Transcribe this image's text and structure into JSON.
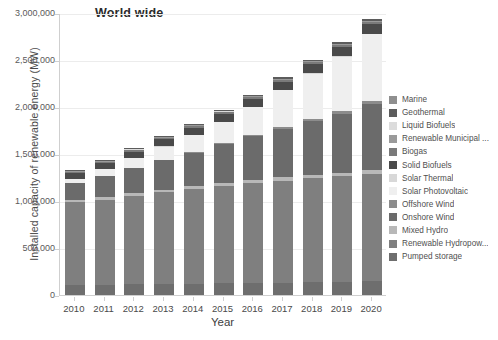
{
  "chart_data": {
    "type": "bar",
    "subtype": "stacked-bar",
    "title": "World wide",
    "xlabel": "Year",
    "ylabel": "Installed capacity of renewable energy (MW)",
    "categories": [
      "2010",
      "2011",
      "2012",
      "2013",
      "2014",
      "2015",
      "2016",
      "2017",
      "2018",
      "2019",
      "2020"
    ],
    "ylim": [
      0,
      3000000
    ],
    "yticks": [
      0,
      500000,
      1000000,
      1500000,
      2000000,
      2500000,
      3000000
    ],
    "ytick_labels": [
      "0",
      "500,000",
      "1,000,000",
      "1,500,000",
      "2,000,000",
      "2,500,000",
      "3,000,000"
    ],
    "grid": true,
    "legend_position": "right",
    "stack_order_bottom_to_top": [
      "Pumped storage",
      "Renewable Hydropower",
      "Mixed Hydro",
      "Onshore Wind",
      "Offshore Wind",
      "Solar Photovoltaic",
      "Solar Thermal",
      "Solid Biofuels",
      "Biogas",
      "Renewable Municipal Waste",
      "Liquid Biofuels",
      "Geothermal",
      "Marine"
    ],
    "series": [
      {
        "name": "Pumped storage",
        "color": "#6e6e6e",
        "values": [
          108000,
          110000,
          112000,
          116000,
          120000,
          124000,
          128000,
          132000,
          136000,
          140000,
          144000
        ]
      },
      {
        "name": "Renewable Hydropower",
        "color": "#7f7f7f",
        "values": [
          880000,
          905000,
          940000,
          975000,
          1005000,
          1035000,
          1060000,
          1085000,
          1105000,
          1125000,
          1145000
        ]
      },
      {
        "name": "Mixed Hydro",
        "color": "#b8b8b8",
        "values": [
          28000,
          29000,
          30000,
          31000,
          32000,
          33000,
          34000,
          35000,
          36000,
          37000,
          38000
        ]
      },
      {
        "name": "Onshore Wind",
        "color": "#6b6b6b",
        "values": [
          178000,
          220000,
          267000,
          312000,
          355000,
          415000,
          468000,
          515000,
          570000,
          625000,
          705000
        ]
      },
      {
        "name": "Offshore Wind",
        "color": "#8c8c8c",
        "values": [
          3000,
          4200,
          5400,
          7100,
          8800,
          12200,
          14400,
          19000,
          23000,
          28000,
          34000
        ]
      },
      {
        "name": "Solar Photovoltaic",
        "color": "#efefef",
        "values": [
          40000,
          70000,
          100000,
          138000,
          177000,
          220000,
          295000,
          390000,
          485000,
          580000,
          710000
        ]
      },
      {
        "name": "Solar Thermal",
        "color": "#d8d8d8",
        "values": [
          1200,
          1700,
          2600,
          3500,
          4400,
          4800,
          4900,
          5100,
          5500,
          6100,
          6400
        ]
      },
      {
        "name": "Solid Biofuels",
        "color": "#4a4a4a",
        "values": [
          62000,
          66000,
          70000,
          74000,
          78000,
          82000,
          86000,
          90000,
          94000,
          98000,
          102000
        ]
      },
      {
        "name": "Biogas",
        "color": "#7a7a7a",
        "values": [
          10000,
          11500,
          13000,
          14500,
          16000,
          17500,
          18500,
          19500,
          20500,
          21500,
          22500
        ]
      },
      {
        "name": "Renewable Municipal Waste",
        "color": "#9a9a9a",
        "values": [
          6500,
          7000,
          7500,
          8000,
          8500,
          9000,
          9500,
          10000,
          10500,
          11000,
          11500
        ]
      },
      {
        "name": "Liquid Biofuels",
        "color": "#dcdcdc",
        "values": [
          1200,
          1300,
          1400,
          1500,
          1600,
          1700,
          1800,
          1900,
          2000,
          2100,
          2200
        ]
      },
      {
        "name": "Geothermal",
        "color": "#5c5c5c",
        "values": [
          10000,
          10400,
          10800,
          11300,
          11800,
          12200,
          12600,
          13100,
          13600,
          14100,
          14600
        ]
      },
      {
        "name": "Marine",
        "color": "#8f8f8f",
        "values": [
          500,
          500,
          500,
          500,
          500,
          500,
          500,
          500,
          500,
          500,
          500
        ]
      }
    ],
    "totals": [
      1328400,
      1436100,
      1559200,
      1691900,
      1818600,
      1966900,
      2133700,
      2315600,
      2501600,
      2707800,
      2935200
    ]
  },
  "legend": {
    "items": [
      {
        "label": "Marine",
        "color": "#8f8f8f"
      },
      {
        "label": "Geothermal",
        "color": "#5c5c5c"
      },
      {
        "label": "Liquid Biofuels",
        "color": "#dcdcdc"
      },
      {
        "label": "Renewable Municipal ...",
        "color": "#9a9a9a"
      },
      {
        "label": "Biogas",
        "color": "#7a7a7a"
      },
      {
        "label": "Solid Biofuels",
        "color": "#4a4a4a"
      },
      {
        "label": "Solar Thermal",
        "color": "#d8d8d8"
      },
      {
        "label": "Solar Photovoltaic",
        "color": "#efefef"
      },
      {
        "label": "Offshore Wind",
        "color": "#8c8c8c"
      },
      {
        "label": "Onshore Wind",
        "color": "#6b6b6b"
      },
      {
        "label": "Mixed Hydro",
        "color": "#b8b8b8"
      },
      {
        "label": "Renewable Hydropow...",
        "color": "#7f7f7f"
      },
      {
        "label": "Pumped storage",
        "color": "#6e6e6e"
      }
    ]
  },
  "colors": {
    "axis": "#cfcfcf",
    "grid": "#ececec",
    "text": "#4a4a4a",
    "title": "#2b2b2b",
    "background": "#ffffff"
  }
}
